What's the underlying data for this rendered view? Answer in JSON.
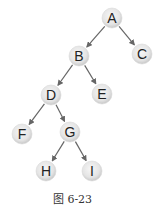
{
  "diagram": {
    "type": "binary-tree",
    "caption": "图 6-23",
    "nodes": [
      {
        "id": "A",
        "label": "A",
        "x": 112,
        "y": 18
      },
      {
        "id": "B",
        "label": "B",
        "x": 79,
        "y": 56
      },
      {
        "id": "C",
        "label": "C",
        "x": 142,
        "y": 54
      },
      {
        "id": "D",
        "label": "D",
        "x": 51,
        "y": 95
      },
      {
        "id": "E",
        "label": "E",
        "x": 102,
        "y": 94
      },
      {
        "id": "F",
        "label": "F",
        "x": 22,
        "y": 134
      },
      {
        "id": "G",
        "label": "G",
        "x": 70,
        "y": 132
      },
      {
        "id": "H",
        "label": "H",
        "x": 46,
        "y": 171
      },
      {
        "id": "I",
        "label": "I",
        "x": 92,
        "y": 171
      }
    ],
    "edges": [
      {
        "from": "A",
        "to": "B"
      },
      {
        "from": "A",
        "to": "C"
      },
      {
        "from": "B",
        "to": "D"
      },
      {
        "from": "B",
        "to": "E"
      },
      {
        "from": "D",
        "to": "F"
      },
      {
        "from": "D",
        "to": "G"
      },
      {
        "from": "G",
        "to": "H"
      },
      {
        "from": "G",
        "to": "I"
      }
    ],
    "node_radius": 10,
    "colors": {
      "node_fill_center": "#f4f4f4",
      "node_fill_edge": "#cfcfcf",
      "edge": "#666666",
      "label": "#222222"
    }
  }
}
